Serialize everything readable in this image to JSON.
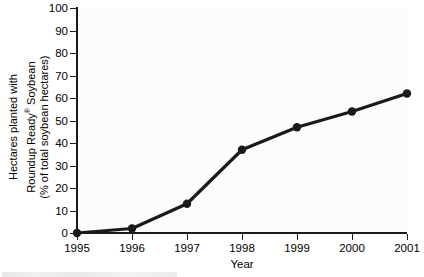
{
  "chart_data": {
    "type": "line",
    "title": "",
    "xlabel": "Year",
    "ylabel": "Hectares planted with Roundup Ready® Soybean (% of total soybean hectares)",
    "ylabel_lines": [
      "Hectares planted with",
      "Roundup Ready",
      "Soybean",
      "(% of total soybean hectares)"
    ],
    "categories": [
      "1995",
      "1996",
      "1997",
      "1998",
      "1999",
      "2000",
      "2001"
    ],
    "values": [
      0,
      2,
      13,
      37,
      47,
      54,
      62
    ],
    "series": [
      {
        "name": "Roundup Ready Soybean",
        "values": [
          0,
          2,
          13,
          37,
          47,
          54,
          62
        ]
      }
    ],
    "xlim": [
      1995,
      2001
    ],
    "ylim": [
      0,
      100
    ],
    "yticks": [
      0,
      10,
      20,
      30,
      40,
      50,
      60,
      70,
      80,
      90,
      100
    ],
    "ytick_labels": [
      "0",
      "10",
      "20",
      "30",
      "40",
      "50",
      "60",
      "70",
      "80",
      "90",
      "100"
    ],
    "xticks": [
      "1995",
      "1996",
      "1997",
      "1998",
      "1999",
      "2000",
      "2001"
    ],
    "grid": false,
    "legend": "none",
    "marker": "filled-circle",
    "line_color": "#1a1a1a",
    "marker_color": "#1a1a1a",
    "background_color": "#fcfcfc",
    "axis_color": "#1a1a1a"
  },
  "ylabel_parts": {
    "line1": "Hectares planted with",
    "line2_pre": "Roundup Ready",
    "line2_sup": "®",
    "line2_post": " Soybean",
    "line3": "(% of total soybean hectares)"
  },
  "axis": {
    "x_title": "Year"
  }
}
